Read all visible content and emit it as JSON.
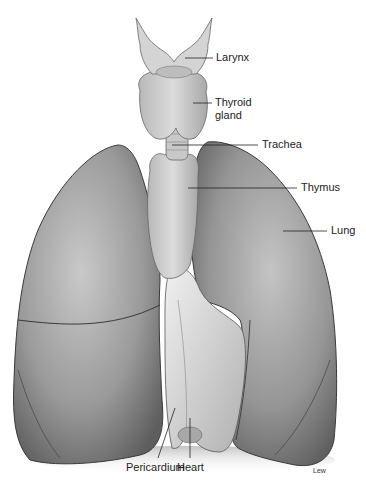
{
  "figure": {
    "labels": [
      {
        "id": "larynx",
        "text": "Larynx"
      },
      {
        "id": "thyroid",
        "text": "Thyroid\ngland"
      },
      {
        "id": "trachea",
        "text": "Trachea"
      },
      {
        "id": "thymus",
        "text": "Thymus"
      },
      {
        "id": "lung",
        "text": "Lung"
      },
      {
        "id": "pericardium",
        "text": "Pericardium"
      },
      {
        "id": "heart",
        "text": "Heart"
      }
    ],
    "credit": "Lew"
  }
}
